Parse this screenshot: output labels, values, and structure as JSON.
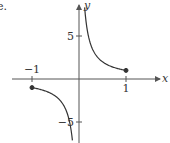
{
  "panel_label": "e.",
  "chart_data": {
    "type": "line",
    "title": "",
    "function": "y = 1/x",
    "xlabel": "x",
    "ylabel": "y",
    "xlim": [
      -1.7,
      1.75
    ],
    "ylim": [
      -7.3,
      8.6
    ],
    "x_ticks": [
      {
        "value": -1,
        "label": "−1"
      },
      {
        "value": 1,
        "label": "1"
      }
    ],
    "y_ticks": [
      {
        "value": 5,
        "label": "5"
      },
      {
        "value": -5,
        "label": "−5"
      }
    ],
    "grid": false,
    "series": [
      {
        "name": "right branch",
        "x": [
          0.12,
          0.15,
          0.2,
          0.25,
          0.3,
          0.4,
          0.5,
          0.6,
          0.7,
          0.8,
          0.9,
          1.0
        ],
        "values": [
          8.33,
          6.67,
          5.0,
          4.0,
          3.33,
          2.5,
          2.0,
          1.67,
          1.43,
          1.25,
          1.11,
          1.0
        ]
      },
      {
        "name": "left branch",
        "x": [
          -1.0,
          -0.9,
          -0.8,
          -0.7,
          -0.6,
          -0.5,
          -0.4,
          -0.3,
          -0.25,
          -0.2,
          -0.17,
          -0.14
        ],
        "values": [
          -1.0,
          -1.11,
          -1.25,
          -1.43,
          -1.67,
          -2.0,
          -2.5,
          -3.33,
          -4.0,
          -5.0,
          -5.88,
          -7.14
        ]
      }
    ],
    "endpoints": [
      {
        "x": 1,
        "y": 1,
        "filled": true
      },
      {
        "x": -1,
        "y": -1,
        "filled": true
      }
    ],
    "colors": {
      "axis": "#555555",
      "curve": "#333333",
      "text": "#333333"
    }
  }
}
